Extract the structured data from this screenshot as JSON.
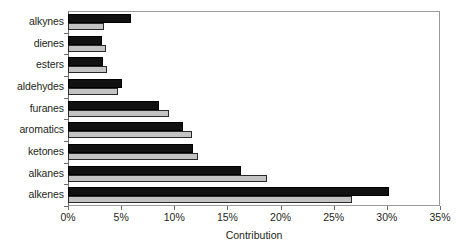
{
  "chart_data": {
    "type": "bar",
    "orientation": "horizontal",
    "title": "",
    "xlabel": "Contribution",
    "ylabel": "",
    "xlim": [
      0,
      35
    ],
    "xticks": [
      0,
      5,
      10,
      15,
      20,
      25,
      30,
      35
    ],
    "xtick_labels": [
      "0%",
      "5%",
      "10%",
      "15%",
      "20%",
      "25%",
      "30%",
      "35%"
    ],
    "grid": false,
    "legend": false,
    "legend_position": "none",
    "categories": [
      "alkenes",
      "alkanes",
      "ketones",
      "aromatics",
      "furanes",
      "aldehydes",
      "esters",
      "dienes",
      "alkynes"
    ],
    "series": [
      {
        "name": "series-black",
        "color": "#111111",
        "values": [
          30.2,
          16.3,
          11.8,
          10.8,
          8.6,
          5.1,
          3.3,
          3.2,
          5.9
        ]
      },
      {
        "name": "series-gray",
        "color": "#c3c3c3",
        "values": [
          26.7,
          18.7,
          12.2,
          11.7,
          9.5,
          4.7,
          3.7,
          3.6,
          3.4
        ]
      }
    ]
  },
  "axis": {
    "x_title": "Contribution",
    "tick_labels_x": [
      "0%",
      "5%",
      "10%",
      "15%",
      "20%",
      "25%",
      "30%",
      "35%"
    ],
    "tick_labels_y": [
      "alkynes",
      "dienes",
      "esters",
      "aldehydes",
      "furanes",
      "aromatics",
      "ketones",
      "alkanes",
      "alkenes"
    ]
  },
  "colors": {
    "bar_black": "#111111",
    "bar_gray": "#c3c3c3",
    "frame": "#9a9a9a",
    "text": "#231f20",
    "background": "#ffffff"
  }
}
